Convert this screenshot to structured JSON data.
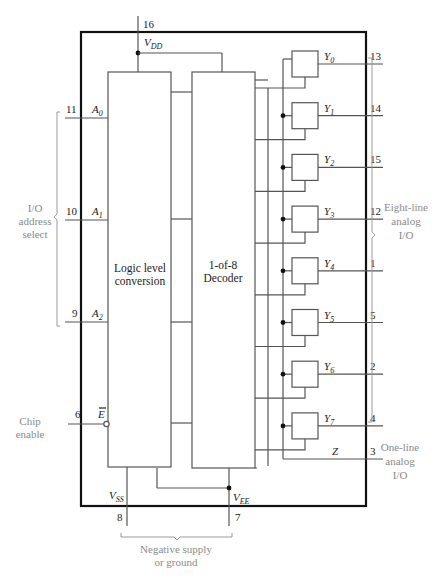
{
  "colors": {
    "frame": "#111111",
    "wire": "#555555",
    "annotation": "#8a8a8a"
  },
  "power": {
    "vdd": {
      "label": "V",
      "sub": "DD",
      "pin": "16"
    },
    "vss": {
      "label": "V",
      "sub": "SS",
      "pin": "8"
    },
    "vee": {
      "label": "V",
      "sub": "EE",
      "pin": "7"
    }
  },
  "inputs": [
    {
      "label": "A",
      "sub": "0",
      "pin": "11"
    },
    {
      "label": "A",
      "sub": "1",
      "pin": "10"
    },
    {
      "label": "A",
      "sub": "2",
      "pin": "9"
    }
  ],
  "enable": {
    "label": "E",
    "pin": "6",
    "overbar": true
  },
  "blocks": {
    "logic": {
      "line1": "Logic level",
      "line2": "conversion"
    },
    "decoder": {
      "line1": "1-of-8",
      "line2": "Decoder"
    }
  },
  "outputs": [
    {
      "label": "Y",
      "sub": "0",
      "pin": "13"
    },
    {
      "label": "Y",
      "sub": "1",
      "pin": "14"
    },
    {
      "label": "Y",
      "sub": "2",
      "pin": "15"
    },
    {
      "label": "Y",
      "sub": "3",
      "pin": "12"
    },
    {
      "label": "Y",
      "sub": "4",
      "pin": "1"
    },
    {
      "label": "Y",
      "sub": "5",
      "pin": "5"
    },
    {
      "label": "Y",
      "sub": "6",
      "pin": "2"
    },
    {
      "label": "Y",
      "sub": "7",
      "pin": "4"
    }
  ],
  "common": {
    "label": "Z",
    "pin": "3"
  },
  "annotations": {
    "address": [
      "I/O",
      "address",
      "select"
    ],
    "chip_enable": [
      "Chip",
      "enable"
    ],
    "eight_line": [
      "Eight-line",
      "analog",
      "I/O"
    ],
    "one_line": [
      "One-line",
      "analog",
      "I/O"
    ],
    "negative_supply": [
      "Negative supply",
      "or ground"
    ]
  }
}
